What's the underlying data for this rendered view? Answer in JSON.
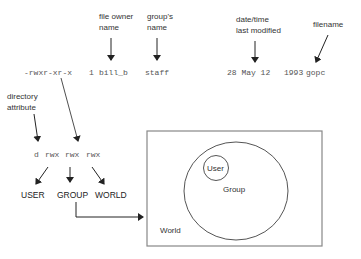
{
  "annotations": {
    "file_owner": [
      "file owner",
      "name"
    ],
    "group_name": [
      "group's",
      "name"
    ],
    "date_modified": [
      "date/time",
      "last modified"
    ],
    "filename": "filename",
    "directory_attribute": [
      "directory",
      "attribute"
    ]
  },
  "ls_line": {
    "permissions": "-rwxr-xr-x",
    "links": "1",
    "owner": "bill_b",
    "group": "staff",
    "date": "28 May 12",
    "size": "1993",
    "name": "gopc"
  },
  "perm_breakdown": {
    "dir": "d",
    "user": "rwx",
    "group": "rwx",
    "world": "rwx"
  },
  "categories": [
    "USER",
    "GROUP",
    "WORLD"
  ],
  "venn": {
    "outer": "World",
    "middle": "Group",
    "inner": "User"
  },
  "colors": {
    "line": "#333333",
    "box": "#888888"
  }
}
